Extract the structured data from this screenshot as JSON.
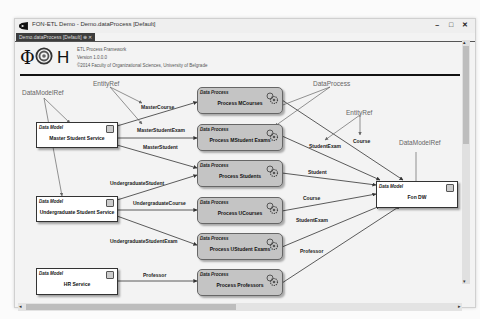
{
  "window": {
    "title": "FON-ETL Demo - Demo.dataProcess [Default]",
    "tab_label": "Demo.dataProcess [Default]",
    "tab_icons": "⊕ ✕",
    "controls": {
      "minimize": "–",
      "maximize": "□",
      "close": "✕"
    }
  },
  "header": {
    "logo_phi": "Φ",
    "logo_h": "H",
    "line1": "ETL Process Framework",
    "line2": "Version 1.0.0.0",
    "line3": "©2014 Faculty of Organizational Sciences, University of Belgrade"
  },
  "annotations": {
    "datamodelref_left": "DataModelRef",
    "entityref_top": "EntityRef",
    "dataprocess_top": "DataProcess",
    "entityref_right": "EntityRef",
    "datamodelref_right": "DataModelRef"
  },
  "data_models": [
    {
      "kind": "Data Model",
      "name": "Master Student Service"
    },
    {
      "kind": "Data Model",
      "name": "Undergraduate Student Service"
    },
    {
      "kind": "Data Model",
      "name": "HR Service"
    },
    {
      "kind": "Data Model",
      "name": "Fon DW"
    }
  ],
  "data_processes": [
    {
      "kind": "Data Process",
      "name": "Process MCourses"
    },
    {
      "kind": "Data Process",
      "name": "Process MStudent Exams"
    },
    {
      "kind": "Data Process",
      "name": "Process Students"
    },
    {
      "kind": "Data Process",
      "name": "Process UCourses"
    },
    {
      "kind": "Data Process",
      "name": "Process UStudent Exams"
    },
    {
      "kind": "Data Process",
      "name": "Process Professors"
    }
  ],
  "edge_labels": {
    "master_course": "MasterCourse",
    "master_student_exam": "MasterStudentExam",
    "master_student": "MasterStudent",
    "undergraduate_student": "UndergraduateStudent",
    "undergraduate_course": "UndergraduateCourse",
    "undergraduate_student_exam": "UndergraduateStudentExam",
    "professor_in": "Professor",
    "student_exam_top": "StudentExam",
    "course_top": "Course",
    "student": "Student",
    "course": "Course",
    "student_exam": "StudentExam",
    "professor_out": "Professor"
  },
  "scroll": {
    "left": "◂",
    "right": "▸",
    "up": "▴",
    "down": "▾"
  }
}
